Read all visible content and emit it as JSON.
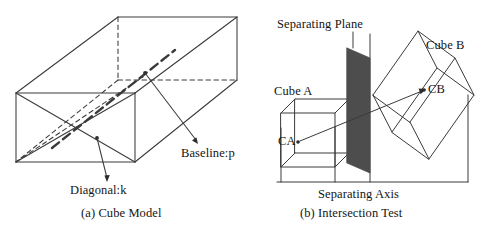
{
  "figure": {
    "type": "diagram",
    "background_color": "#ffffff",
    "line_color": "#3a3a3a",
    "plane_fill_color": "#4d4d4d",
    "panels": [
      {
        "id": "a",
        "caption": "(a) Cube Model",
        "annotations": [
          {
            "name": "baseline",
            "text": "Baseline:p"
          },
          {
            "name": "diagonal",
            "text": "Diagonal:k"
          }
        ]
      },
      {
        "id": "b",
        "caption": "(b) Intersection Test",
        "annotations": [
          {
            "name": "separating-plane",
            "text": "Separating Plane"
          },
          {
            "name": "cube-a",
            "text": "Cube A"
          },
          {
            "name": "cube-b",
            "text": "Cube B"
          },
          {
            "name": "centroid-a",
            "text": "CA"
          },
          {
            "name": "centroid-b",
            "text": "CB"
          },
          {
            "name": "separating-axis",
            "text": "Separating Axis"
          }
        ]
      }
    ]
  }
}
